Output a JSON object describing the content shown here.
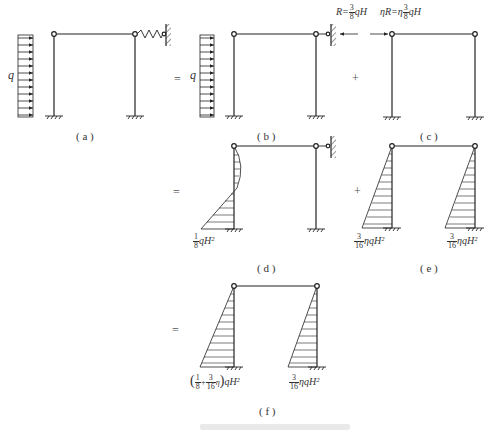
{
  "figure": {
    "panels": [
      {
        "id": "a",
        "label": "( a )"
      },
      {
        "id": "b",
        "label": "( b )"
      },
      {
        "id": "c",
        "label": "( c )"
      },
      {
        "id": "d",
        "label": "( d )"
      },
      {
        "id": "e",
        "label": "( e )"
      },
      {
        "id": "f",
        "label": "( f )"
      }
    ],
    "load_symbol": "q",
    "operators": {
      "eq1": "=",
      "plus1": "+",
      "eq2": "=",
      "plus2": "+",
      "eq3": "="
    },
    "reaction": {
      "R_prefix": "R=",
      "R_num": "3",
      "R_den": "8",
      "R_suffix": "qH",
      "etaR_prefix": "ηR=η",
      "etaR_num": "3",
      "etaR_den": "8",
      "etaR_suffix": "qH"
    },
    "moments": {
      "d_base": {
        "num": "1",
        "den": "8",
        "suffix": "qH²"
      },
      "e_left": {
        "num": "3",
        "den": "16",
        "suffix": "ηqH²"
      },
      "e_right": {
        "num": "3",
        "den": "16",
        "suffix": "ηqH²"
      },
      "f_left": {
        "open": "(",
        "num1": "1",
        "den1": "8",
        "plus": "+",
        "num2": "3",
        "den2": "16",
        "eta": "η",
        "close": ")",
        "suffix": "qH²"
      },
      "f_right": {
        "num": "3",
        "den": "16",
        "suffix": "ηqH²"
      }
    },
    "caption": ""
  }
}
